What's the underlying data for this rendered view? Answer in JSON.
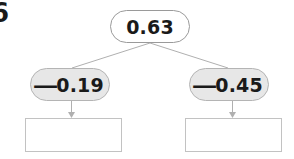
{
  "question": {
    "number": "6"
  },
  "tree": {
    "root": {
      "label": "0.63",
      "value": 0.63
    },
    "operands": [
      {
        "sign": "—",
        "number": "0.19",
        "label": "−0.19",
        "value": -0.19,
        "position": "left"
      },
      {
        "sign": "—",
        "number": "0.45",
        "label": "−0.45",
        "value": -0.45,
        "position": "right"
      }
    ],
    "answers": [
      {
        "value": "",
        "placeholder": "",
        "position": "left"
      },
      {
        "value": "",
        "placeholder": "",
        "position": "right"
      }
    ]
  },
  "colors": {
    "page_background": "#ffffff",
    "root_pill_fill": "#ffffff",
    "root_pill_border": "#9a9a9a",
    "operand_pill_fill": "#e7e7e7",
    "operand_pill_border": "#b4b4b4",
    "answer_box_border": "#c2c2c2",
    "connector_line": "#b0b0b0",
    "text": "#1a1a1a"
  }
}
